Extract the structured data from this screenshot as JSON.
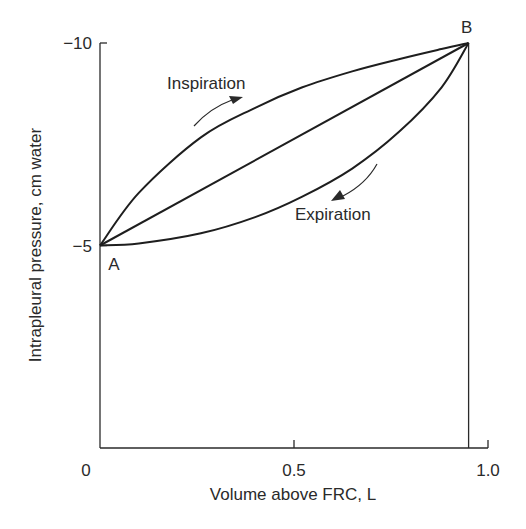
{
  "chart_data": {
    "type": "line",
    "title": "",
    "xlabel": "Volume above FRC, L",
    "ylabel": "Intrapleural pressure, cm water",
    "xlim": [
      0,
      1.0
    ],
    "ylim": [
      0,
      -10
    ],
    "y_inverted": true,
    "grid": false,
    "x_ticks": [
      {
        "value": 0,
        "label": "0"
      },
      {
        "value": 0.5,
        "label": "0.5"
      },
      {
        "value": 1.0,
        "label": "1.0"
      }
    ],
    "y_ticks": [
      {
        "value": -10,
        "label": "−10"
      },
      {
        "value": -5,
        "label": "−5"
      }
    ],
    "points": [
      {
        "label": "A",
        "x": 0,
        "y": -5
      },
      {
        "label": "B",
        "x": 0.95,
        "y": -10
      }
    ],
    "series": [
      {
        "name": "Inspiration",
        "x": [
          0,
          0.1,
          0.26,
          0.4,
          0.52,
          0.65,
          0.77,
          0.88,
          0.95
        ],
        "y": [
          -5,
          -6.3,
          -7.67,
          -8.4,
          -8.9,
          -9.3,
          -9.6,
          -9.85,
          -10
        ]
      },
      {
        "name": "Expiration",
        "x": [
          0,
          0.1,
          0.26,
          0.4,
          0.52,
          0.65,
          0.77,
          0.88,
          0.95
        ],
        "y": [
          -5,
          -5.05,
          -5.3,
          -5.7,
          -6.2,
          -6.9,
          -7.8,
          -8.9,
          -10
        ]
      },
      {
        "name": "Static line A-B",
        "x": [
          0,
          0.95
        ],
        "y": [
          -5,
          -10
        ]
      }
    ],
    "annotations": [
      {
        "text": "Inspiration",
        "near_series": "Inspiration",
        "arrow_direction": "toward B"
      },
      {
        "text": "Expiration",
        "near_series": "Expiration",
        "arrow_direction": "toward A"
      }
    ]
  }
}
